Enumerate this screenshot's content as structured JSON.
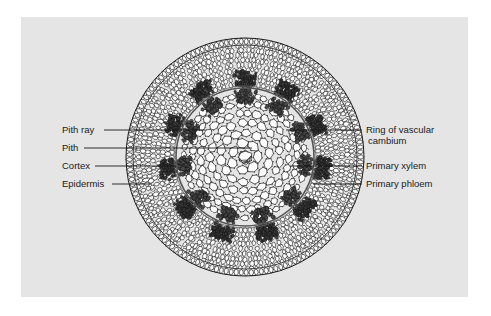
{
  "figure": {
    "kind": "botanical-cross-section-diagram",
    "background_color": "#e5e5e5",
    "page_color": "#ffffff",
    "ink_color": "#1a1a1a"
  },
  "labels_left": [
    {
      "id": "pith-ray",
      "text": "Pith ray",
      "text_x": 62,
      "text_y": 133,
      "line_x1": 104,
      "line_y1": 130,
      "line_x2": 205,
      "line_y2": 130
    },
    {
      "id": "pith",
      "text": "Pith",
      "text_x": 62,
      "text_y": 151,
      "line_x1": 84,
      "line_y1": 148,
      "line_x2": 252,
      "line_y2": 148
    },
    {
      "id": "cortex",
      "text": "Cortex",
      "text_x": 62,
      "text_y": 169,
      "line_x1": 95,
      "line_y1": 166,
      "line_x2": 175,
      "line_y2": 166
    },
    {
      "id": "epidermis",
      "text": "Epidermis",
      "text_x": 62,
      "text_y": 187,
      "line_x1": 112,
      "line_y1": 184,
      "line_x2": 152,
      "line_y2": 184
    }
  ],
  "labels_right": [
    {
      "id": "ring-of-vascular-cambium",
      "text": "Ring of vascular",
      "text2": "cambium",
      "text_x": 366,
      "text_y": 133,
      "text2_y": 144,
      "line_x1": 362,
      "line_y1": 130,
      "line_x2": 286,
      "line_y2": 130
    },
    {
      "id": "primary-xylem",
      "text": "Primary xylem",
      "text_x": 366,
      "text_y": 169,
      "line_x1": 362,
      "line_y1": 166,
      "line_x2": 290,
      "line_y2": 166
    },
    {
      "id": "primary-phloem",
      "text": "Primary phloem",
      "text_x": 366,
      "text_y": 187,
      "line_x1": 362,
      "line_y1": 184,
      "line_x2": 313,
      "line_y2": 184
    }
  ],
  "stem": {
    "center_x": 245,
    "center_y": 157,
    "epidermis_radius": 119,
    "epidermis_inner_radius": 112,
    "cortex_inner_radius": 71,
    "cambium_radius": 69,
    "pith_radius": 64,
    "bundle_count": 11,
    "bundle_start_angle": -90
  }
}
